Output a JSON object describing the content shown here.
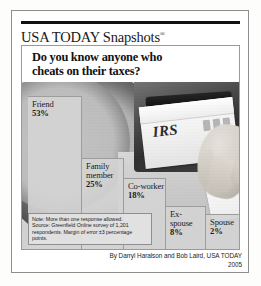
{
  "masthead": {
    "title": "USA TODAY Snapshots",
    "registered_mark": "®"
  },
  "headline": {
    "line1": "Do you know anyone who",
    "line2": "cheats on their taxes?"
  },
  "photo": {
    "envelope_label": "IRS",
    "description": "hand placing IRS envelope into mailbox"
  },
  "note": {
    "line1": "Note: More than one response allowed.",
    "line2": "Source: Greenfield Online survey of 1,201",
    "line3": "respondents. Margin of error ±3 percentage points."
  },
  "byline": {
    "credit": "By Darryl Haralson and Bob Laird, USA TODAY",
    "year": "2005"
  },
  "colors": {
    "bar_fill": "#d4d4d4",
    "bar_stroke": "#9d9d9d",
    "rule": "#111111",
    "text": "#1c1c1c"
  },
  "chart_data": {
    "type": "bar",
    "title": "Do you know anyone who cheats on their taxes?",
    "xlabel": "",
    "ylabel": "",
    "ylim": [
      0,
      53
    ],
    "grid": false,
    "legend": "none",
    "orientation": "vertical-descending-staircase",
    "categories": [
      "Friend",
      "Family member",
      "Co-worker",
      "Ex-spouse",
      "Spouse"
    ],
    "values": [
      53,
      25,
      18,
      8,
      2
    ],
    "value_labels": [
      "53%",
      "25%",
      "18%",
      "8%",
      "2%"
    ],
    "note": "More than one response allowed.",
    "source": "Greenfield Online survey of 1,201 respondents. Margin of error ±3 percentage points.",
    "bars": [
      {
        "label": "Friend",
        "value": 53,
        "pct": "53%",
        "x": 6,
        "w": 54,
        "top": 14
      },
      {
        "label": "Family member",
        "value": 25,
        "pct": "25%",
        "x": 60,
        "w": 42,
        "top": 76
      },
      {
        "label": "Co-worker",
        "value": 18,
        "pct": "18%",
        "x": 102,
        "w": 42,
        "top": 96
      },
      {
        "label": "Ex-spouse",
        "value": 8,
        "pct": "8%",
        "x": 144,
        "w": 40,
        "top": 124
      },
      {
        "label": "Spouse",
        "value": 2,
        "pct": "2%",
        "x": 184,
        "w": 34,
        "top": 132
      }
    ]
  }
}
